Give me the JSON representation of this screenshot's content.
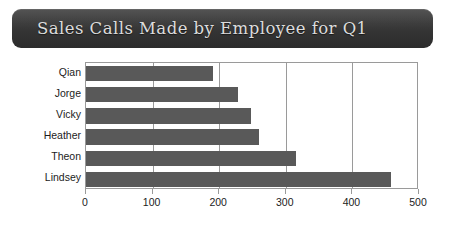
{
  "chart_data": {
    "type": "bar",
    "orientation": "horizontal",
    "title": "Sales Calls Made by Employee for Q1",
    "xlabel": "",
    "ylabel": "",
    "categories": [
      "Qian",
      "Jorge",
      "Vicky",
      "Heather",
      "Theon",
      "Lindsey"
    ],
    "values": [
      190,
      228,
      248,
      260,
      315,
      458
    ],
    "xlim": [
      0,
      500
    ],
    "xticks": [
      0,
      100,
      200,
      300,
      400,
      500
    ],
    "xtick_labels": [
      "0",
      "100",
      "200",
      "300",
      "400",
      "500"
    ],
    "grid": "vertical",
    "legend": "none",
    "series": [
      {
        "name": "Sales Calls",
        "values": [
          190,
          228,
          248,
          260,
          315,
          458
        ]
      }
    ]
  },
  "style": {
    "bar_color": "#595959",
    "banner_color": "#333333",
    "title_color": "#dcdcdc",
    "axis_color": "#9a9a9a",
    "text_color": "#1c1c1c",
    "background": "#ffffff"
  }
}
